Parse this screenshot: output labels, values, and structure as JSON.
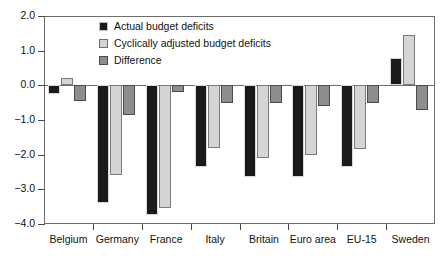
{
  "chart_data": {
    "type": "bar",
    "title": "",
    "subtitle": "",
    "xlabel": "",
    "ylabel": "",
    "ylim": [
      -4.0,
      2.0
    ],
    "yticks": [
      "2.0",
      "1.0",
      "0.0",
      "-1.0",
      "-2.0",
      "-3.0",
      "-4.0"
    ],
    "ytick_values": [
      2.0,
      1.0,
      0.0,
      -1.0,
      -2.0,
      -3.0,
      -4.0
    ],
    "grid": false,
    "legend_position": "top-center",
    "categories": [
      "Belgium",
      "Germany",
      "France",
      "Italy",
      "Britain",
      "Euro area",
      "EU-15",
      "Sweden"
    ],
    "series": [
      {
        "name": "Actual budget deficits",
        "color": "#1a1a1a",
        "values": [
          -0.25,
          -3.4,
          -3.75,
          -2.35,
          -2.65,
          -2.65,
          -2.35,
          0.8
        ]
      },
      {
        "name": "Cyclically adjusted budget deficits",
        "color": "#d5d5d5",
        "values": [
          0.2,
          -2.6,
          -3.55,
          -1.8,
          -2.1,
          -2.0,
          -1.85,
          1.45
        ]
      },
      {
        "name": "Difference",
        "color": "#8e8e8e",
        "values": [
          -0.45,
          -0.85,
          -0.2,
          -0.5,
          -0.5,
          -0.6,
          -0.5,
          -0.7
        ]
      }
    ]
  }
}
